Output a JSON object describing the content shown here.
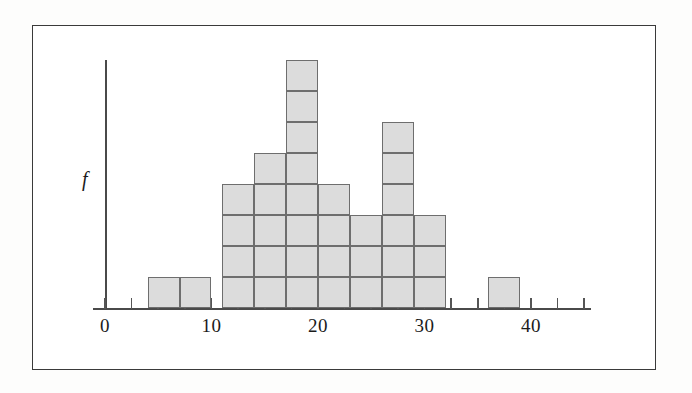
{
  "figure": {
    "title": "",
    "y_axis_label": "f",
    "x_axis_labels": [
      "0",
      "10",
      "20",
      "30",
      "40"
    ]
  },
  "chart_data": {
    "type": "bar",
    "title": "",
    "xlabel": "",
    "ylabel": "f",
    "subtitle": "Frequency histogram with stacked unit blocks",
    "bin_width": 3,
    "bin_starts": [
      4,
      7,
      11,
      14,
      17,
      20,
      23,
      26,
      29,
      36
    ],
    "bin_ends": [
      7,
      10,
      14,
      17,
      20,
      23,
      26,
      29,
      32,
      39
    ],
    "categories": [
      "4-7",
      "7-10",
      "11-14",
      "14-17",
      "17-20",
      "20-23",
      "23-26",
      "26-29",
      "29-32",
      "36-39"
    ],
    "values": [
      1,
      1,
      4,
      5,
      8,
      4,
      3,
      6,
      3,
      1
    ],
    "xlim": [
      0,
      47
    ],
    "ylim": [
      0,
      8
    ],
    "xticks": [
      0,
      2.5,
      5,
      7.5,
      10,
      12.5,
      15,
      17.5,
      20,
      22.5,
      25,
      27.5,
      30,
      32.5,
      35,
      37.5,
      40,
      42.5,
      45
    ],
    "xtick_labels_shown": {
      "0": "0",
      "10": "10",
      "20": "20",
      "30": "30",
      "40": "40"
    },
    "grid": false,
    "legend": false,
    "bar_fill_color": "#dcdcdc",
    "bar_edge_color": "#6e6e6e",
    "axis_color": "#4a4a4a",
    "frame_color": "#3a3a3a",
    "background_color": "#ffffff"
  }
}
